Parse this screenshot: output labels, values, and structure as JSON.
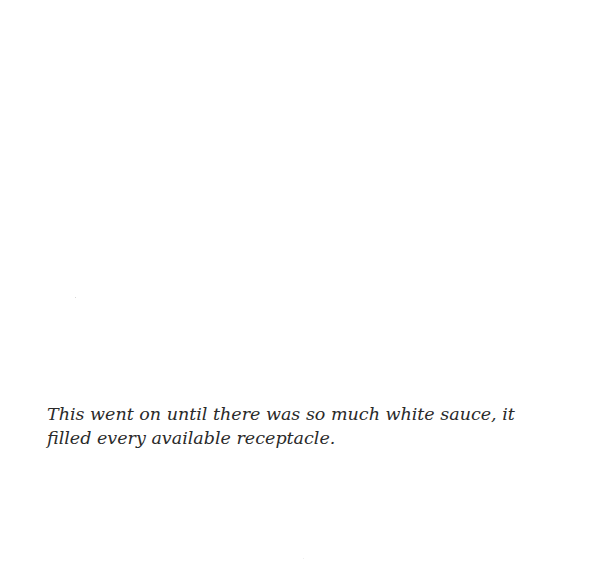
{
  "page": {
    "background_color": "#ffffff",
    "caption": {
      "lines": [
        "This went on until there was so much white sauce, it",
        "filled every available receptacle."
      ],
      "text_color": "#2a2a2a"
    }
  }
}
